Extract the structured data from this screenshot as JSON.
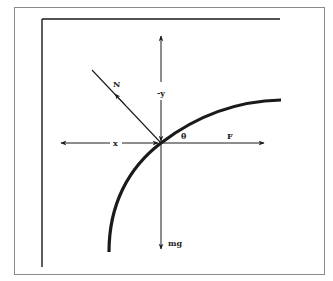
{
  "diagram": {
    "type": "free-body-diagram",
    "labels": {
      "normal_force": "N",
      "negative_y": "-y",
      "x_axis": "x",
      "angle": "θ",
      "applied_force": "F",
      "weight": "mg"
    },
    "colors": {
      "line": "#1a1a1a",
      "frame": "#8a8a8a",
      "background": "#ffffff"
    },
    "geometry": {
      "origin": [
        161,
        143
      ],
      "curve": "quarter-arc from bottom (109,252) through origin to top-right (281,100)"
    }
  }
}
